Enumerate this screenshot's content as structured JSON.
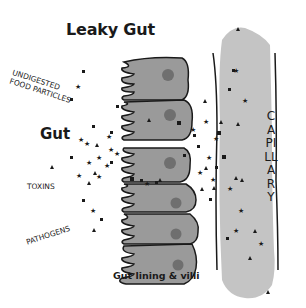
{
  "title": "Leaky Gut",
  "labels": {
    "gut": "Gut",
    "undigested_line1": "UNDIGESTED",
    "undigested_line2": "FOOD PARTICLES",
    "toxins": "TOXINS",
    "pathogens": "PATHOGENS",
    "gut_lining": "Gut lining & villi",
    "capillary": "CAPILLARY"
  },
  "colors": {
    "cell_fill": "#9a9a9a",
    "nucleus": "#6f6f6f",
    "capillary_fill": "#c4c4c4",
    "ink": "#1a1a1a"
  },
  "legend_symbols": {
    "undigested_food_particles": "square",
    "toxins": "triangle",
    "pathogens": "star"
  },
  "cells": [
    {
      "y": 62,
      "h": 38
    },
    {
      "y": 100,
      "h": 40
    },
    {
      "y": 148,
      "h": 34
    },
    {
      "y": 182,
      "h": 30
    },
    {
      "y": 212,
      "h": 30
    },
    {
      "y": 242,
      "h": 40
    }
  ]
}
